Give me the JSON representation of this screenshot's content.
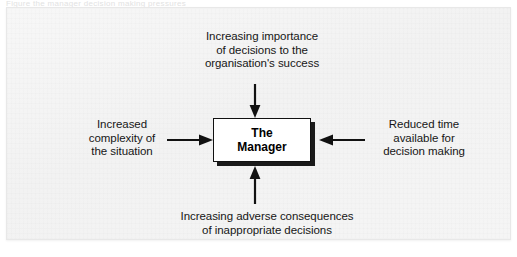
{
  "figure": {
    "caption_remnant": "Figure   the manager   decision making pressures",
    "center": {
      "label": "The\nManager"
    },
    "factors": [
      {
        "id": "top",
        "position": "top",
        "label": "Increasing importance\nof decisions to the\norganisation's success",
        "arrow": "arrow-down-icon"
      },
      {
        "id": "left",
        "position": "left",
        "label": "Increased\ncomplexity of\nthe situation",
        "arrow": "arrow-right-icon"
      },
      {
        "id": "right",
        "position": "right",
        "label": "Reduced time\navailable for\ndecision making",
        "arrow": "arrow-left-icon"
      },
      {
        "id": "bottom",
        "position": "bottom",
        "label": "Increasing adverse consequences\nof inappropriate decisions",
        "arrow": "arrow-up-icon"
      }
    ],
    "colors": {
      "page_background": "#f4f4f4",
      "box_fill": "#ffffff",
      "box_border": "#111111",
      "box_shadow": "#1a1a1a",
      "text": "#161616",
      "arrow": "#111111"
    }
  }
}
